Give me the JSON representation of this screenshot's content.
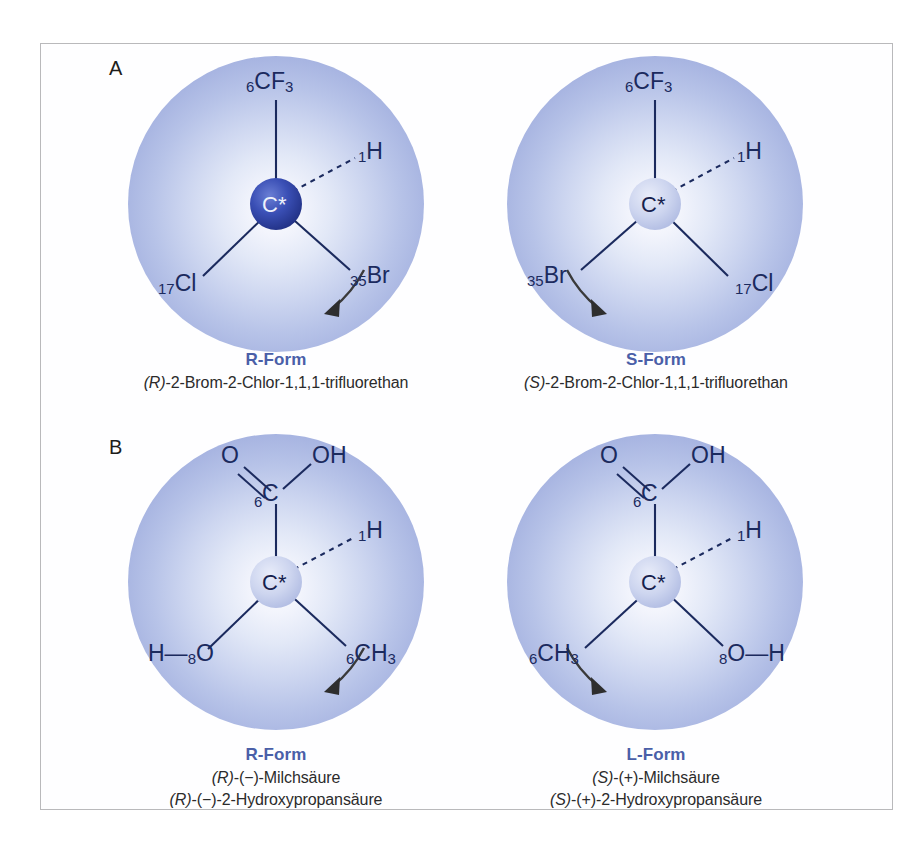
{
  "figure": {
    "panels": [
      {
        "letter": "A",
        "left": {
          "center_atom": "C*",
          "center_style": "dark",
          "substituents": [
            {
              "name": "top",
              "number": "6",
              "symbol": "CF",
              "subscript": "3",
              "bond": "plain"
            },
            {
              "name": "upper-right",
              "number": "1",
              "symbol": "H",
              "subscript": "",
              "bond": "dashed"
            },
            {
              "name": "lower-left",
              "number": "17",
              "symbol": "Cl",
              "subscript": "",
              "bond": "plain"
            },
            {
              "name": "lower-right",
              "number": "35",
              "symbol": "Br",
              "subscript": "",
              "bond": "plain"
            }
          ],
          "arrow_direction": "clockwise",
          "caption_title": "R-Form",
          "caption_lines": [
            "(R)-2-Brom-2-Chlor-1,1,1-trifluorethan"
          ]
        },
        "right": {
          "center_atom": "C*",
          "center_style": "light",
          "substituents": [
            {
              "name": "top",
              "number": "6",
              "symbol": "CF",
              "subscript": "3",
              "bond": "plain"
            },
            {
              "name": "upper-right",
              "number": "1",
              "symbol": "H",
              "subscript": "",
              "bond": "dashed"
            },
            {
              "name": "lower-left",
              "number": "35",
              "symbol": "Br",
              "subscript": "",
              "bond": "plain"
            },
            {
              "name": "lower-right",
              "number": "17",
              "symbol": "Cl",
              "subscript": "",
              "bond": "plain"
            }
          ],
          "arrow_direction": "counterclockwise",
          "caption_title": "S-Form",
          "caption_lines": [
            "(S)-2-Brom-2-Chlor-1,1,1-trifluorethan"
          ]
        }
      },
      {
        "letter": "B",
        "left": {
          "center_atom": "C*",
          "center_style": "light",
          "carboxyl": {
            "carbon": "C",
            "carbon_number": "6",
            "double_bond_atom": "O",
            "hydroxyl": "OH"
          },
          "substituents": [
            {
              "name": "upper-right",
              "number": "1",
              "symbol": "H",
              "subscript": "",
              "bond": "dashed"
            },
            {
              "name": "lower-left",
              "number": "8",
              "symbol": "O",
              "subscript": "",
              "prefix": "H—",
              "bond": "plain"
            },
            {
              "name": "lower-right",
              "number": "6",
              "symbol": "CH",
              "subscript": "3",
              "bond": "plain"
            }
          ],
          "arrow_direction": "clockwise",
          "caption_title": "R-Form",
          "caption_lines": [
            "(R)-(−)-Milchsäure",
            "(R)-(−)-2-Hydroxypropansäure"
          ]
        },
        "right": {
          "center_atom": "C*",
          "center_style": "light",
          "carboxyl": {
            "carbon": "C",
            "carbon_number": "6",
            "double_bond_atom": "O",
            "hydroxyl": "OH"
          },
          "substituents": [
            {
              "name": "upper-right",
              "number": "1",
              "symbol": "H",
              "subscript": "",
              "bond": "dashed"
            },
            {
              "name": "lower-left",
              "number": "6",
              "symbol": "CH",
              "subscript": "3",
              "bond": "plain"
            },
            {
              "name": "lower-right",
              "number": "8",
              "symbol": "O",
              "subscript": "",
              "suffix": "—H",
              "bond": "plain"
            }
          ],
          "arrow_direction": "counterclockwise",
          "caption_title": "L-Form",
          "caption_lines": [
            "(S)-(+)-Milchsäure",
            "(S)-(+)-2-Hydroxypropansäure"
          ]
        }
      }
    ],
    "colors": {
      "caption_title": "#4a5fa8",
      "caption_body": "#2b2b2b",
      "sphere_edge": "#94a3d8",
      "bond": "#1b2a5e",
      "center_dark": "#2b3f9e",
      "frame_border": "#b9b9bb"
    }
  }
}
